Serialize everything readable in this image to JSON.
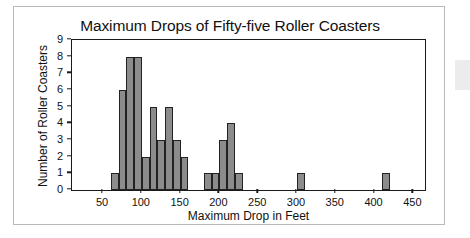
{
  "figure": {
    "title": "Maximum Drops of Fifty-five Roller Coasters",
    "background_color": "#ffffff",
    "frame_border_color": "#b9b9b9",
    "axis_color": "#1a1a1a"
  },
  "chart_data": {
    "type": "bar",
    "title": "Maximum Drops of Fifty-five Roller Coasters",
    "xlabel": "Maximum Drop in Feet",
    "ylabel": "Number of Roller Coasters",
    "xlim": [
      10,
      465
    ],
    "ylim": [
      0,
      9
    ],
    "grid": false,
    "legend": null,
    "bin_width": 10,
    "bar_color": "#8c8c8c",
    "bar_edge_color": "#222222",
    "x_ticks": [
      50,
      100,
      150,
      200,
      250,
      300,
      350,
      400,
      450
    ],
    "x_tick_labels": [
      "50",
      "100",
      "150",
      "200",
      "250",
      "300",
      "350",
      "400",
      "450"
    ],
    "y_ticks": [
      0,
      1,
      2,
      3,
      4,
      5,
      6,
      7,
      8,
      9
    ],
    "y_tick_labels": [
      "0",
      "1",
      "2",
      "3",
      "4",
      "5",
      "6",
      "7",
      "8",
      "9"
    ],
    "bins": [
      {
        "start": 60,
        "end": 70,
        "count": 1
      },
      {
        "start": 70,
        "end": 80,
        "count": 6
      },
      {
        "start": 80,
        "end": 90,
        "count": 8
      },
      {
        "start": 90,
        "end": 100,
        "count": 8
      },
      {
        "start": 100,
        "end": 110,
        "count": 2
      },
      {
        "start": 110,
        "end": 120,
        "count": 5
      },
      {
        "start": 120,
        "end": 130,
        "count": 3
      },
      {
        "start": 130,
        "end": 140,
        "count": 5
      },
      {
        "start": 140,
        "end": 150,
        "count": 3
      },
      {
        "start": 150,
        "end": 160,
        "count": 2
      },
      {
        "start": 180,
        "end": 190,
        "count": 1
      },
      {
        "start": 190,
        "end": 200,
        "count": 1
      },
      {
        "start": 200,
        "end": 210,
        "count": 3
      },
      {
        "start": 210,
        "end": 220,
        "count": 4
      },
      {
        "start": 220,
        "end": 230,
        "count": 1
      },
      {
        "start": 300,
        "end": 310,
        "count": 1
      },
      {
        "start": 410,
        "end": 420,
        "count": 1
      }
    ],
    "categories": [
      "60-70",
      "70-80",
      "80-90",
      "90-100",
      "100-110",
      "110-120",
      "120-130",
      "130-140",
      "140-150",
      "150-160",
      "180-190",
      "190-200",
      "200-210",
      "210-220",
      "220-230",
      "300-310",
      "410-420"
    ],
    "values": [
      1,
      6,
      8,
      8,
      2,
      5,
      3,
      5,
      3,
      2,
      1,
      1,
      3,
      4,
      1,
      1,
      1
    ],
    "total_observations": 55
  }
}
